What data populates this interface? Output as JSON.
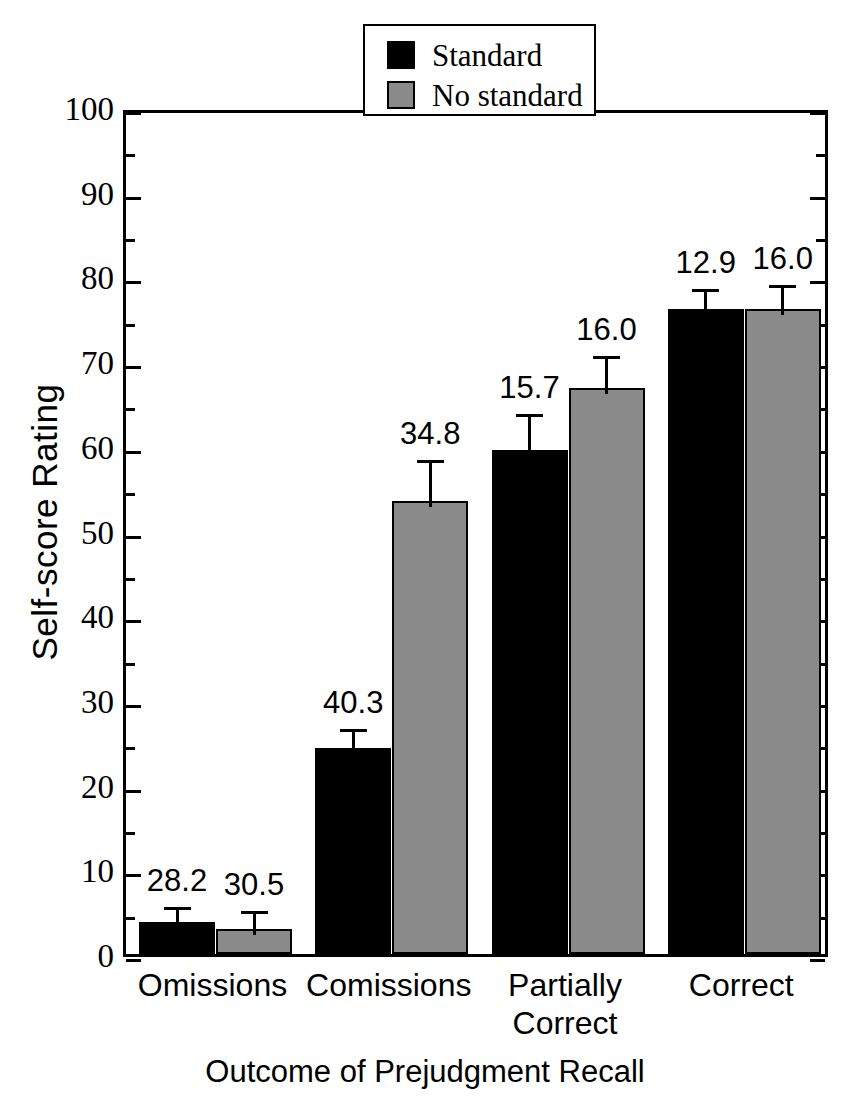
{
  "chart_data": {
    "type": "bar",
    "title": "",
    "xlabel": "Outcome of Prejudgment Recall",
    "ylabel": "Self-score Rating",
    "ylim": [
      0,
      100
    ],
    "ytick_step": 10,
    "yminor_step": 5,
    "grid": false,
    "legend_position": "top-center",
    "categories": [
      "Omissions",
      "Comissions",
      "Partially\nCorrect",
      "Correct"
    ],
    "series": [
      {
        "name": "Standard",
        "color": "#000000",
        "values": [
          3.8,
          24.3,
          59.5,
          76.2
        ],
        "errors": [
          2.4,
          3.0,
          5.0,
          3.0
        ],
        "labels": [
          "28.2",
          "40.3",
          "15.7",
          "12.9"
        ]
      },
      {
        "name": "No standard",
        "color": "#8a8a8a",
        "values": [
          3.0,
          53.5,
          66.8,
          76.2
        ],
        "errors": [
          2.8,
          5.5,
          4.5,
          3.5
        ],
        "labels": [
          "30.5",
          "34.8",
          "16.0",
          "16.0"
        ]
      }
    ],
    "ytick_labels": [
      "100",
      "90",
      "80",
      "70",
      "60",
      "50",
      "40",
      "30",
      "20",
      "10",
      "0"
    ],
    "annotation_note": "Numbers above each bar are standard deviations"
  },
  "legend": {
    "items": [
      {
        "label": "Standard",
        "color": "#000000"
      },
      {
        "label": "No standard",
        "color": "#8a8a8a"
      }
    ]
  },
  "axes": {
    "y_title": "Self-score Rating",
    "x_title": "Outcome of Prejudgment Recall"
  }
}
